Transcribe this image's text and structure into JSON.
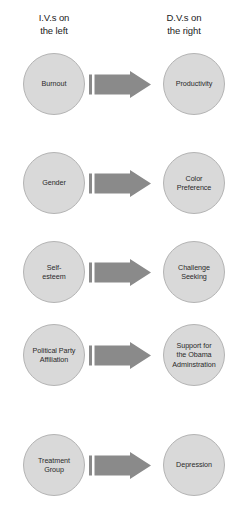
{
  "diagram": {
    "headers": {
      "left": "I.V.s on\nthe left",
      "right": "D.V.s on\nthe right"
    },
    "arrow_icon": "right-arrow-icon",
    "colors": {
      "node_fill": "#d9d9d9",
      "node_stroke": "#b4b4b4",
      "arrow_fill": "#8a8a8a",
      "text": "#2a2a2a",
      "background": "#ffffff"
    },
    "rows": [
      {
        "iv": "Burnout",
        "dv": "Productivity"
      },
      {
        "iv": "Gender",
        "dv": "Color\nPreference"
      },
      {
        "iv": "Self-\nesteem",
        "dv": "Challenge\nSeeking"
      },
      {
        "iv": "Political Party\nAffiliation",
        "dv": "Support for\nthe Obama\nAdminstration"
      },
      {
        "iv": "Treatment\nGroup",
        "dv": "Depression"
      }
    ]
  }
}
